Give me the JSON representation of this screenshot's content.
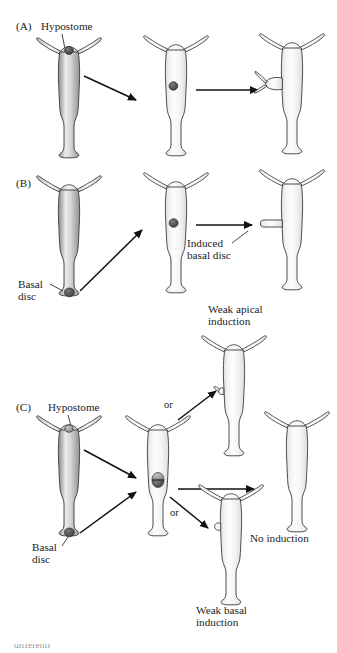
{
  "figure": {
    "colors": {
      "outline": "#3a3a3a",
      "body_light": "#fbfbfb",
      "body_mid": "#d9d9d9",
      "body_shadow": "#9a9a9a",
      "graft_dark": "#4a4a4a",
      "graft_mid": "#8d8d8d",
      "arrow": "#111111",
      "text": "#1b1b1b"
    },
    "panels": [
      {
        "id": "A",
        "label": "(A)",
        "annotations": [
          {
            "name": "hypostome-label",
            "text": "Hypostome"
          }
        ],
        "organisms": [
          {
            "name": "donor-hydra",
            "graft_site": "hypostome",
            "has_bud": false
          },
          {
            "name": "host-hydra-grafted",
            "graft_site": "mid-body",
            "has_bud": false
          },
          {
            "name": "result-hydra",
            "graft_site": "none",
            "has_bud": true
          }
        ],
        "arrows": 2
      },
      {
        "id": "B",
        "label": "(B)",
        "annotations": [
          {
            "name": "basal-disc-label",
            "text": "Basal\ndisc"
          },
          {
            "name": "induced-basal-disc-label",
            "text": "Induced\nbasal disc"
          }
        ],
        "organisms": [
          {
            "name": "donor-hydra",
            "graft_site": "basal-disc",
            "has_bud": false
          },
          {
            "name": "host-hydra-grafted",
            "graft_site": "mid-body",
            "has_bud": false
          },
          {
            "name": "result-hydra",
            "graft_site": "none",
            "has_bud": true
          }
        ],
        "arrows": 2
      },
      {
        "id": "C",
        "label": "(C)",
        "annotations": [
          {
            "name": "hypostome-label",
            "text": "Hypostome"
          },
          {
            "name": "basal-disc-label",
            "text": "Basal\ndisc"
          },
          {
            "name": "weak-apical-induction-label",
            "text": "Weak apical\ninduction"
          },
          {
            "name": "no-induction-label",
            "text": "No induction"
          },
          {
            "name": "weak-basal-induction-label",
            "text": "Weak basal\ninduction"
          },
          {
            "name": "or-label-upper",
            "text": "or"
          },
          {
            "name": "or-label-lower",
            "text": "or"
          }
        ],
        "organisms": [
          {
            "name": "donor-hydra",
            "graft_site": "hypostome-and-basal-disc",
            "has_bud": false
          },
          {
            "name": "host-hydra-grafted",
            "graft_site": "mid-body-double",
            "has_bud": false
          },
          {
            "name": "outcome-weak-apical",
            "graft_site": "none",
            "has_bud": true
          },
          {
            "name": "outcome-no-induction",
            "graft_site": "none",
            "has_bud": false
          },
          {
            "name": "outcome-weak-basal",
            "graft_site": "none",
            "has_bud": true
          }
        ],
        "arrows": 5
      }
    ],
    "labels": {
      "panel_a": "(A)",
      "panel_b": "(B)",
      "panel_c": "(C)",
      "hypostome_a": "Hypostome",
      "basal_b_line1": "Basal",
      "basal_b_line2": "disc",
      "induced_line1": "Induced",
      "induced_line2": "basal disc",
      "hypostome_c": "Hypostome",
      "basal_c_line1": "Basal",
      "basal_c_line2": "disc",
      "weak_apical_line1": "Weak apical",
      "weak_apical_line2": "induction",
      "no_induction": "No induction",
      "weak_basal_line1": "Weak basal",
      "weak_basal_line2": "induction",
      "or_upper": "or",
      "or_lower": "or"
    },
    "caption_fragment": "differenti"
  }
}
